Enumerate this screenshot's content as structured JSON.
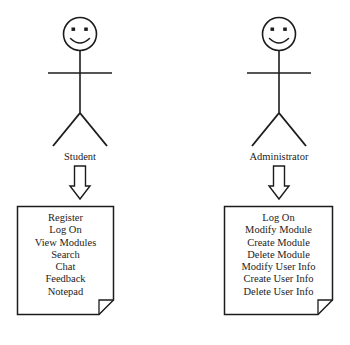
{
  "diagram": {
    "type": "uml-use-case-diagram",
    "background_color": "#ffffff",
    "stroke_color": "#1c1c1c",
    "text_color": "#1c1c1c",
    "actors": [
      {
        "id": "student",
        "label": "Student",
        "icon": "stick-figure-smiley-actor",
        "connector": "hollow-down-arrow",
        "note": {
          "icon": "note-folded-corner",
          "items": [
            "Register",
            "Log On",
            "View Modules",
            "Search",
            "Chat",
            "Feedback",
            "Notepad"
          ]
        }
      },
      {
        "id": "administrator",
        "label": "Administrator",
        "icon": "stick-figure-smiley-actor",
        "connector": "hollow-down-arrow",
        "note": {
          "icon": "note-folded-corner",
          "items": [
            "Log On",
            "Modify Module",
            "Create Module",
            "Delete Module",
            "Modify User Info",
            "Create User Info",
            "Delete User Info"
          ]
        }
      }
    ]
  }
}
